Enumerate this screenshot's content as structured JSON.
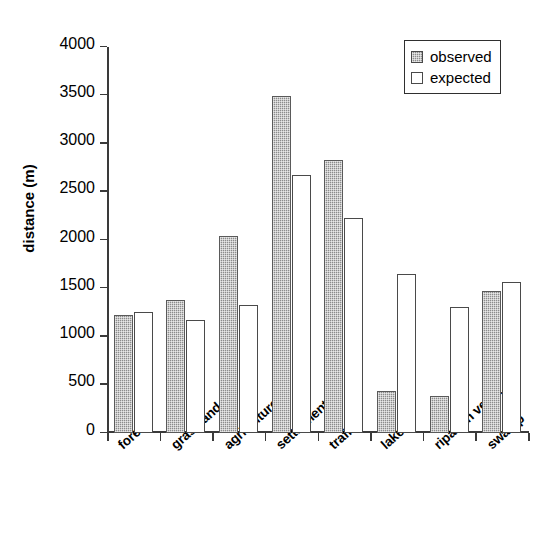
{
  "chart_data": {
    "type": "bar",
    "title": "",
    "subtitle": "",
    "xlabel": "",
    "ylabel": "distance (m)",
    "categories": [
      "forest",
      "grassland",
      "agriculture",
      "settlement",
      "traffic",
      "lake",
      "riparian veget.",
      "swamp"
    ],
    "series": [
      {
        "name": "observed",
        "values": [
          1220,
          1380,
          2045,
          3490,
          2830,
          440,
          380,
          1470
        ],
        "fill": "#8c8c8c",
        "pattern": "checkered-gray"
      },
      {
        "name": "expected",
        "values": [
          1250,
          1170,
          1330,
          2670,
          2230,
          1650,
          1310,
          1570
        ],
        "fill": "#ffffff",
        "pattern": "solid-white"
      }
    ],
    "ylim": [
      0,
      4000
    ],
    "ytick_values": [
      0,
      500,
      1000,
      1500,
      2000,
      2500,
      3000,
      3500,
      4000
    ],
    "ytick_labels": [
      "0",
      "500",
      "1000",
      "1500",
      "2000",
      "2500",
      "3000",
      "3500",
      "4000"
    ],
    "grid": false,
    "legend_position": "top-right",
    "axis_color": "#3a3a3a",
    "background": "#ffffff"
  },
  "legend": {
    "entries": [
      {
        "label": "observed"
      },
      {
        "label": "expected"
      }
    ]
  }
}
